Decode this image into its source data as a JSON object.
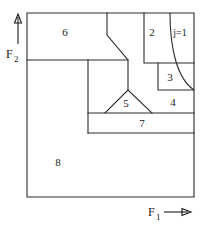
{
  "figure": {
    "title": "",
    "type": "region-partition-diagram",
    "background": "#ffffff",
    "line_color": "#2b2b2b",
    "width": 204,
    "height": 228
  },
  "axes": {
    "x": {
      "label": "F",
      "subscript": "1",
      "arrow_direction": "right",
      "label_x": 152,
      "label_y": 215
    },
    "y": {
      "label": "F",
      "subscript": "2",
      "arrow_direction": "up",
      "label_x": 6,
      "label_y": 52
    }
  },
  "frame": {
    "left": 27,
    "top": 13,
    "right": 194,
    "bottom": 197
  },
  "regions": [
    {
      "id": "region-2",
      "label": "2",
      "x": 152,
      "y": 33
    },
    {
      "id": "region-3",
      "label": "3",
      "x": 170,
      "y": 78
    },
    {
      "id": "region-4",
      "label": "4",
      "x": 172,
      "y": 103
    },
    {
      "id": "region-5",
      "label": "5",
      "x": 125,
      "y": 103
    },
    {
      "id": "region-6",
      "label": "6",
      "x": 65,
      "y": 33
    },
    {
      "id": "region-7",
      "label": "7",
      "x": 142,
      "y": 124
    },
    {
      "id": "region-8",
      "label": "8",
      "x": 58,
      "y": 163
    }
  ],
  "annotations": [
    {
      "id": "j-equals-1",
      "label": "j=1",
      "x": 179,
      "y": 34
    }
  ],
  "geometry": {
    "outer_rect": "M27,13 L194,13 L194,197 L27,197 Z",
    "horizontal_upper": "M27,60 L128,60",
    "zigzag_upper": "M107,13 L107,35 L128,60 L128,90",
    "vertical_mid": "M88,60 L88,133",
    "triangle_5": "M105,113 L128,90 L152,113 Z",
    "horizontal_7_top": "M88,113 L194,113",
    "horizontal_7_bottom": "M88,133 L194,133",
    "box_2": "M144,13 L144,63 L194,63",
    "box_3": "M158,63 L158,90 L194,90",
    "curve_j1": "M170,13 C170,45 176,78 194,90"
  }
}
